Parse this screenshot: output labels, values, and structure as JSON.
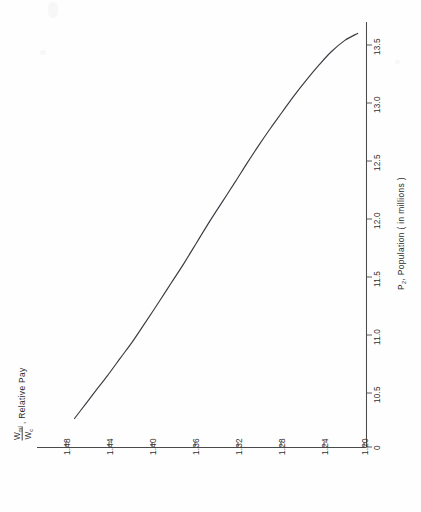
{
  "figure": {
    "orientation": "rotated-90-ccw",
    "background_color": "#fefefe",
    "ink_color": "#3a3a42"
  },
  "chart_data": {
    "type": "line",
    "title": "",
    "subtitle": "",
    "xlabel": "P2, Population ( in millions )",
    "ylabel": "Wml/Wc , Relative Pay",
    "grid": false,
    "legend": null,
    "xlim": [
      10.2,
      13.7
    ],
    "ylim": [
      1.185,
      1.495
    ],
    "x_ticks": [
      "0",
      "10.5",
      "11.0",
      "11.5",
      "12.0",
      "12.5",
      "13.0",
      "13.5"
    ],
    "x_tick_values": [
      0,
      10.5,
      11.0,
      11.5,
      12.0,
      12.5,
      13.0,
      13.5
    ],
    "y_ticks": [
      "1.48",
      "1.44",
      "1.40",
      "1.36",
      "1.32",
      "1.28",
      "1.24",
      "1.20"
    ],
    "y_tick_values": [
      1.48,
      1.44,
      1.4,
      1.36,
      1.32,
      1.28,
      1.24,
      1.2
    ],
    "y_axis_direction": "descending",
    "series": [
      {
        "name": "Relative Pay",
        "x": [
          10.28,
          10.4,
          10.52,
          10.65,
          10.8,
          10.95,
          11.1,
          11.28,
          11.45,
          11.62,
          11.8,
          11.98,
          12.15,
          12.32,
          12.48,
          12.62,
          12.78,
          12.92,
          13.06,
          13.2,
          13.32,
          13.44,
          13.54,
          13.6
        ],
        "y": [
          1.472,
          1.462,
          1.452,
          1.441,
          1.429,
          1.417,
          1.406,
          1.393,
          1.381,
          1.369,
          1.357,
          1.345,
          1.333,
          1.321,
          1.31,
          1.3,
          1.288,
          1.277,
          1.266,
          1.254,
          1.243,
          1.231,
          1.218,
          1.206
        ]
      }
    ]
  },
  "axis_labels": {
    "y_axis_numerator": "W",
    "y_axis_numerator_sub": "ml",
    "y_axis_denominator": "W",
    "y_axis_denominator_sub": "c",
    "y_axis_suffix": ", Relative  Pay",
    "x_axis_symbol": "P",
    "x_axis_symbol_sub": "2",
    "x_axis_suffix": ", Population ( in millions )"
  }
}
